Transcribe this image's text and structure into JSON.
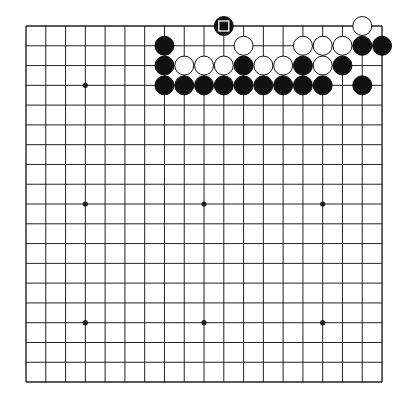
{
  "board": {
    "size": 19,
    "origin": {
      "x": 26,
      "y": 26
    },
    "spacing": 19.78,
    "line_color": "#222222",
    "background": "#ffffff",
    "hoshi": [
      [
        3,
        3
      ],
      [
        9,
        3
      ],
      [
        15,
        3
      ],
      [
        3,
        9
      ],
      [
        9,
        9
      ],
      [
        15,
        9
      ],
      [
        3,
        15
      ],
      [
        9,
        15
      ],
      [
        15,
        15
      ]
    ],
    "stones": [
      {
        "col": 10,
        "row": 0,
        "color": "black",
        "marker": "square"
      },
      {
        "col": 17,
        "row": 0,
        "color": "white"
      },
      {
        "col": 7,
        "row": 1,
        "color": "black"
      },
      {
        "col": 11,
        "row": 1,
        "color": "white"
      },
      {
        "col": 14,
        "row": 1,
        "color": "white"
      },
      {
        "col": 15,
        "row": 1,
        "color": "white"
      },
      {
        "col": 16,
        "row": 1,
        "color": "white"
      },
      {
        "col": 17,
        "row": 1,
        "color": "black"
      },
      {
        "col": 18,
        "row": 1,
        "color": "black"
      },
      {
        "col": 7,
        "row": 2,
        "color": "black"
      },
      {
        "col": 8,
        "row": 2,
        "color": "white"
      },
      {
        "col": 9,
        "row": 2,
        "color": "white"
      },
      {
        "col": 10,
        "row": 2,
        "color": "white"
      },
      {
        "col": 11,
        "row": 2,
        "color": "black"
      },
      {
        "col": 12,
        "row": 2,
        "color": "white"
      },
      {
        "col": 13,
        "row": 2,
        "color": "white"
      },
      {
        "col": 14,
        "row": 2,
        "color": "black"
      },
      {
        "col": 15,
        "row": 2,
        "color": "white"
      },
      {
        "col": 16,
        "row": 2,
        "color": "black"
      },
      {
        "col": 7,
        "row": 3,
        "color": "black"
      },
      {
        "col": 8,
        "row": 3,
        "color": "black"
      },
      {
        "col": 9,
        "row": 3,
        "color": "black"
      },
      {
        "col": 10,
        "row": 3,
        "color": "black"
      },
      {
        "col": 11,
        "row": 3,
        "color": "black"
      },
      {
        "col": 12,
        "row": 3,
        "color": "black"
      },
      {
        "col": 13,
        "row": 3,
        "color": "black"
      },
      {
        "col": 14,
        "row": 3,
        "color": "black"
      },
      {
        "col": 15,
        "row": 3,
        "color": "black"
      },
      {
        "col": 17,
        "row": 3,
        "color": "black"
      }
    ],
    "colors": {
      "black_stone": "#111111",
      "white_stone": "#ffffff",
      "stone_outline": "#111111",
      "marker": "#ffffff"
    }
  }
}
